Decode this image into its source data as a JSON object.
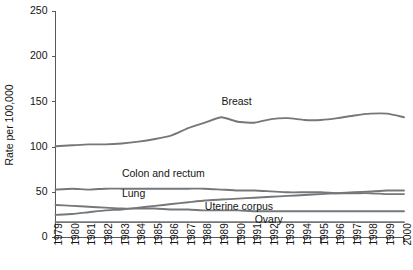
{
  "chart_data": {
    "type": "line",
    "title": "",
    "subtitle": "",
    "xlabel": "",
    "ylabel": "Rate per 100,000",
    "xlim": [
      1979,
      2000
    ],
    "ylim": [
      0,
      250
    ],
    "yticks": [
      0,
      50,
      100,
      150,
      200,
      250
    ],
    "grid": false,
    "legend_position": "inline-labels",
    "x": [
      1979,
      1980,
      1981,
      1982,
      1983,
      1984,
      1985,
      1986,
      1987,
      1988,
      1989,
      1990,
      1991,
      1992,
      1993,
      1994,
      1995,
      1996,
      1997,
      1998,
      1999,
      2000
    ],
    "categories": [
      "1979",
      "1980",
      "1981",
      "1982",
      "1983",
      "1984",
      "1985",
      "1986",
      "1987",
      "1988",
      "1989",
      "1990",
      "1991",
      "1992",
      "1993",
      "1994",
      "1995",
      "1996",
      "1997",
      "1998",
      "1999",
      "2000"
    ],
    "series": [
      {
        "name": "Breast",
        "color": "#74787b",
        "values": [
          101,
          102,
          103,
          103,
          104,
          106,
          109,
          113,
          121,
          127,
          133,
          128,
          127,
          131,
          132,
          130,
          130,
          132,
          135,
          137,
          137,
          133
        ]
      },
      {
        "name": "Colon and rectum",
        "color": "#74787b",
        "values": [
          53,
          54,
          53,
          54,
          54,
          54,
          54,
          54,
          54,
          54,
          53,
          52,
          52,
          51,
          50,
          50,
          50,
          49,
          49,
          49,
          48,
          48
        ]
      },
      {
        "name": "Lung",
        "color": "#74787b",
        "values": [
          25,
          26,
          28,
          30,
          31,
          33,
          35,
          37,
          39,
          41,
          42,
          43,
          44,
          45,
          46,
          47,
          48,
          49,
          50,
          51,
          52,
          52
        ]
      },
      {
        "name": "Uterine corpus",
        "color": "#74787b",
        "values": [
          36,
          35,
          34,
          33,
          32,
          32,
          32,
          31,
          31,
          30,
          30,
          30,
          29,
          29,
          29,
          29,
          29,
          29,
          29,
          29,
          29,
          29
        ]
      },
      {
        "name": "Ovary",
        "color": "#74787b",
        "values": [
          17,
          17,
          17,
          17,
          17,
          17,
          17,
          17,
          17,
          17,
          17,
          17,
          17,
          17,
          17,
          17,
          17,
          17,
          17,
          17,
          17,
          17
        ]
      }
    ],
    "annotations": [
      {
        "text": "Breast",
        "x": 1989,
        "y": 150
      },
      {
        "text": "Colon and rectum",
        "x": 1983,
        "y": 70
      },
      {
        "text": "Lung",
        "x": 1983,
        "y": 48
      },
      {
        "text": "Uterine corpus",
        "x": 1988,
        "y": 34
      },
      {
        "text": "Ovary",
        "x": 1991,
        "y": 19
      }
    ]
  },
  "axes": {
    "y_title": "Rate per 100,000",
    "y_tick_labels": [
      "0",
      "50",
      "100",
      "150",
      "200",
      "250"
    ],
    "x_tick_labels": [
      "1979",
      "1980",
      "1981",
      "1982",
      "1983",
      "1984",
      "1985",
      "1986",
      "1987",
      "1988",
      "1989",
      "1990",
      "1991",
      "1992",
      "1993",
      "1994",
      "1995",
      "1996",
      "1997",
      "1998",
      "1999",
      "2000"
    ]
  },
  "series_labels": {
    "breast": "Breast",
    "colon_and_rectum": "Colon and rectum",
    "lung": "Lung",
    "uterine_corpus": "Uterine corpus",
    "ovary": "Ovary"
  }
}
